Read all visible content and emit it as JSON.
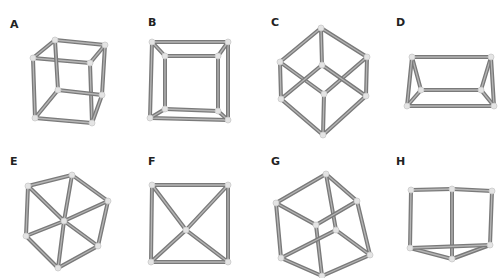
{
  "figures": [
    {
      "label": "A",
      "label_pos": [
        10,
        18
      ],
      "nodes": [
        [
          55,
          40
        ],
        [
          105,
          45
        ],
        [
          33,
          58
        ],
        [
          90,
          63
        ],
        [
          58,
          90
        ],
        [
          102,
          95
        ],
        [
          35,
          118
        ],
        [
          92,
          123
        ]
      ],
      "edges": [
        [
          0,
          1
        ],
        [
          0,
          2
        ],
        [
          1,
          3
        ],
        [
          2,
          3
        ],
        [
          0,
          4
        ],
        [
          1,
          5
        ],
        [
          2,
          6
        ],
        [
          3,
          7
        ],
        [
          4,
          5
        ],
        [
          4,
          6
        ],
        [
          5,
          7
        ],
        [
          6,
          7
        ]
      ]
    },
    {
      "label": "B",
      "label_pos": [
        148,
        16
      ],
      "nodes": [
        [
          152,
          42
        ],
        [
          228,
          42
        ],
        [
          150,
          118
        ],
        [
          228,
          120
        ],
        [
          165,
          56
        ],
        [
          218,
          56
        ],
        [
          165,
          109
        ],
        [
          218,
          111
        ]
      ],
      "edges": [
        [
          0,
          1
        ],
        [
          0,
          2
        ],
        [
          1,
          3
        ],
        [
          2,
          3
        ],
        [
          4,
          5
        ],
        [
          4,
          6
        ],
        [
          5,
          7
        ],
        [
          6,
          7
        ],
        [
          0,
          4
        ],
        [
          1,
          5
        ],
        [
          2,
          6
        ],
        [
          3,
          7
        ]
      ]
    },
    {
      "label": "C",
      "label_pos": [
        271,
        16
      ],
      "nodes": [
        [
          321,
          28
        ],
        [
          280,
          62
        ],
        [
          367,
          57
        ],
        [
          322,
          65
        ],
        [
          281,
          99
        ],
        [
          324,
          94
        ],
        [
          366,
          96
        ],
        [
          323,
          135
        ]
      ],
      "edges": [
        [
          0,
          1
        ],
        [
          0,
          2
        ],
        [
          0,
          3
        ],
        [
          1,
          4
        ],
        [
          2,
          6
        ],
        [
          1,
          5
        ],
        [
          2,
          5
        ],
        [
          3,
          4
        ],
        [
          3,
          6
        ],
        [
          5,
          7
        ],
        [
          4,
          7
        ],
        [
          6,
          7
        ]
      ]
    },
    {
      "label": "D",
      "label_pos": [
        396,
        16
      ],
      "nodes": [
        [
          412,
          57
        ],
        [
          491,
          57
        ],
        [
          421,
          90
        ],
        [
          481,
          90
        ],
        [
          407,
          106
        ],
        [
          494,
          106
        ]
      ],
      "edges": [
        [
          0,
          1
        ],
        [
          0,
          2
        ],
        [
          1,
          3
        ],
        [
          2,
          3
        ],
        [
          0,
          4
        ],
        [
          1,
          5
        ],
        [
          2,
          4
        ],
        [
          3,
          5
        ],
        [
          4,
          5
        ]
      ]
    },
    {
      "label": "E",
      "label_pos": [
        10,
        155
      ],
      "nodes": [
        [
          28,
          186
        ],
        [
          72,
          175
        ],
        [
          108,
          201
        ],
        [
          64,
          221
        ],
        [
          26,
          236
        ],
        [
          98,
          246
        ],
        [
          58,
          268
        ]
      ],
      "edges": [
        [
          0,
          1
        ],
        [
          1,
          2
        ],
        [
          0,
          4
        ],
        [
          2,
          5
        ],
        [
          4,
          6
        ],
        [
          5,
          6
        ],
        [
          0,
          3
        ],
        [
          1,
          3
        ],
        [
          2,
          3
        ],
        [
          4,
          3
        ],
        [
          5,
          3
        ],
        [
          6,
          3
        ]
      ]
    },
    {
      "label": "F",
      "label_pos": [
        148,
        155
      ],
      "nodes": [
        [
          152,
          185
        ],
        [
          228,
          185
        ],
        [
          186,
          230
        ],
        [
          151,
          262
        ],
        [
          228,
          262
        ]
      ],
      "edges": [
        [
          0,
          1
        ],
        [
          0,
          3
        ],
        [
          1,
          4
        ],
        [
          3,
          4
        ],
        [
          0,
          2
        ],
        [
          1,
          2
        ],
        [
          3,
          2
        ],
        [
          4,
          2
        ]
      ]
    },
    {
      "label": "G",
      "label_pos": [
        271,
        155
      ],
      "nodes": [
        [
          326,
          174
        ],
        [
          276,
          203
        ],
        [
          357,
          201
        ],
        [
          316,
          225
        ],
        [
          336,
          230
        ],
        [
          281,
          258
        ],
        [
          370,
          255
        ],
        [
          322,
          276
        ]
      ],
      "edges": [
        [
          0,
          1
        ],
        [
          0,
          2
        ],
        [
          0,
          4
        ],
        [
          1,
          3
        ],
        [
          2,
          3
        ],
        [
          1,
          5
        ],
        [
          2,
          6
        ],
        [
          3,
          7
        ],
        [
          4,
          5
        ],
        [
          4,
          6
        ],
        [
          5,
          7
        ],
        [
          6,
          7
        ]
      ]
    },
    {
      "label": "H",
      "label_pos": [
        396,
        155
      ],
      "nodes": [
        [
          411,
          190
        ],
        [
          452,
          189
        ],
        [
          492,
          191
        ],
        [
          410,
          248
        ],
        [
          490,
          245
        ],
        [
          452,
          259
        ]
      ],
      "edges": [
        [
          0,
          1
        ],
        [
          1,
          2
        ],
        [
          0,
          3
        ],
        [
          1,
          5
        ],
        [
          2,
          4
        ],
        [
          3,
          5
        ],
        [
          4,
          5
        ],
        [
          3,
          4
        ]
      ]
    }
  ]
}
